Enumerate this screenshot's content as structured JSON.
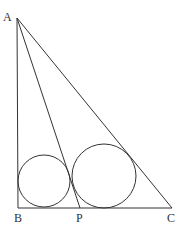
{
  "diagram": {
    "type": "geometry",
    "points": {
      "A": {
        "label": "A",
        "x": 17,
        "y": 18
      },
      "B": {
        "label": "B",
        "x": 18,
        "y": 208
      },
      "P": {
        "label": "P",
        "x": 80,
        "y": 208
      },
      "C": {
        "label": "C",
        "x": 172,
        "y": 208
      }
    },
    "segments": [
      {
        "from": "A",
        "to": "B"
      },
      {
        "from": "B",
        "to": "C"
      },
      {
        "from": "A",
        "to": "C"
      },
      {
        "from": "A",
        "to": "P"
      }
    ],
    "circles": [
      {
        "name": "incircle-ABP",
        "cx": 44,
        "cy": 181,
        "r": 26
      },
      {
        "name": "incircle-APC",
        "cx": 104,
        "cy": 176,
        "r": 32
      }
    ],
    "stroke_color": "#333333"
  }
}
